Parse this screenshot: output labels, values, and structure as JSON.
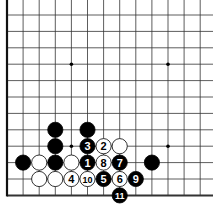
{
  "diagram": {
    "type": "go-board",
    "grid": {
      "x0": 7,
      "y0": 15,
      "dx": 16.1,
      "dy": 16.4,
      "cols": 13,
      "rows": 12,
      "left_edge": true,
      "bottom_edge": true
    },
    "hoshi": [
      [
        3,
        3
      ],
      [
        9,
        3
      ],
      [
        3,
        8
      ],
      [
        9,
        8
      ]
    ],
    "stones": [
      {
        "c": 2,
        "r": 7,
        "color": "black",
        "label": ""
      },
      {
        "c": 4,
        "r": 7,
        "color": "black",
        "label": ""
      },
      {
        "c": 2,
        "r": 8,
        "color": "black",
        "label": ""
      },
      {
        "c": 4,
        "r": 8,
        "color": "black",
        "label": "3"
      },
      {
        "c": 5,
        "r": 8,
        "color": "white",
        "label": "2"
      },
      {
        "c": 6,
        "r": 8,
        "color": "white",
        "label": ""
      },
      {
        "c": 0,
        "r": 9,
        "color": "black",
        "label": ""
      },
      {
        "c": 1,
        "r": 9,
        "color": "white",
        "label": ""
      },
      {
        "c": 2,
        "r": 9,
        "color": "black",
        "label": ""
      },
      {
        "c": 3,
        "r": 9,
        "color": "white",
        "label": ""
      },
      {
        "c": 4,
        "r": 9,
        "color": "black",
        "label": "1"
      },
      {
        "c": 5,
        "r": 9,
        "color": "white",
        "label": "8"
      },
      {
        "c": 6,
        "r": 9,
        "color": "black",
        "label": "7"
      },
      {
        "c": 8,
        "r": 9,
        "color": "black",
        "label": ""
      },
      {
        "c": 1,
        "r": 10,
        "color": "white",
        "label": ""
      },
      {
        "c": 2,
        "r": 10,
        "color": "white",
        "label": ""
      },
      {
        "c": 3,
        "r": 10,
        "color": "white",
        "label": "4"
      },
      {
        "c": 4,
        "r": 10,
        "color": "white",
        "label": "10"
      },
      {
        "c": 5,
        "r": 10,
        "color": "black",
        "label": "5"
      },
      {
        "c": 6,
        "r": 10,
        "color": "white",
        "label": "6"
      },
      {
        "c": 7,
        "r": 10,
        "color": "black",
        "label": "9"
      },
      {
        "c": 6,
        "r": 11,
        "color": "black",
        "label": "11"
      }
    ]
  }
}
